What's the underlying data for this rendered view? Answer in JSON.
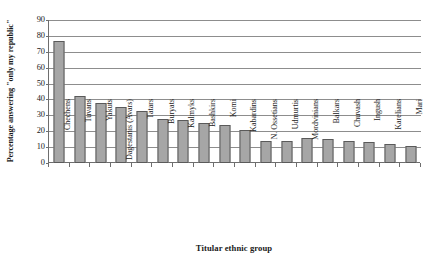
{
  "chart_data": {
    "type": "bar",
    "title": "",
    "xlabel": "Titular ethnic group",
    "ylabel": "Percentage answering \"only my republic\"",
    "ylim": [
      0,
      90
    ],
    "yticks": [
      0,
      10,
      20,
      30,
      40,
      50,
      60,
      70,
      80,
      90
    ],
    "grid": true,
    "legend": "none",
    "categories": [
      "Chechens",
      "Tuvans",
      "Yakuts",
      "Dagestanis (Avars)",
      "Tatars",
      "Buryats",
      "Kalmyks",
      "Bashkirs",
      "Komi",
      "Kabardins",
      "N. Ossetians",
      "Udmurtis",
      "Mordvinians",
      "Balkars",
      "Chuvash",
      "Ingush",
      "Karelians",
      "Mari"
    ],
    "values": [
      77,
      42,
      38,
      35,
      33,
      28,
      27,
      25,
      24,
      21,
      14,
      14,
      16,
      15,
      14,
      13,
      12,
      11
    ]
  },
  "bar_style": {
    "fill": "#a6a6a6",
    "stroke": "#5a5a5a"
  },
  "axis_style": {
    "line": "#6e6e6e",
    "grid": "#8d8d8d"
  }
}
